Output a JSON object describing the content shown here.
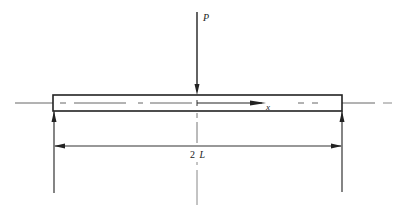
{
  "diagram": {
    "type": "simply-supported-beam-with-central-point-load",
    "labels": {
      "load": "P",
      "axis": "x",
      "span_number": "2",
      "span_symbol": "L"
    },
    "colors": {
      "line": "#222222",
      "centerline": "#555555",
      "background": "#ffffff"
    },
    "elements": {
      "beam": {
        "x1": 53,
        "x2": 342,
        "y_top": 95,
        "y_bottom": 111
      },
      "load_line_x": 197,
      "left_support_x": 53,
      "right_support_x": 342,
      "dimension_line_y": 146
    }
  }
}
